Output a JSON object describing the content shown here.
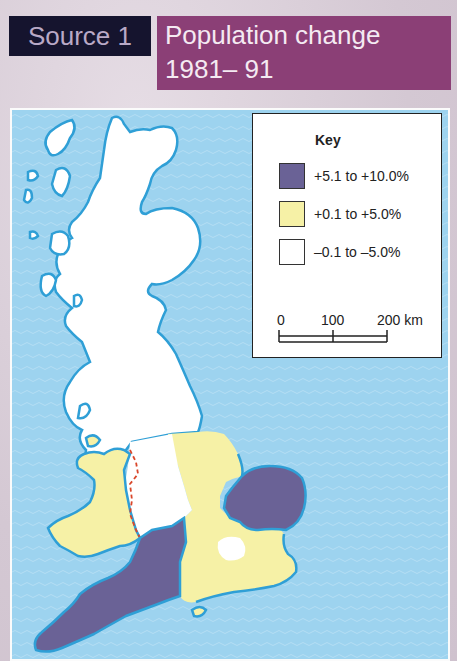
{
  "header": {
    "source_label": "Source 1",
    "title_line1": "Population change",
    "title_line2": "1981– 91"
  },
  "colors": {
    "source_bg": "#15142e",
    "title_bg": "#8b3f76",
    "sea": "#9dd3ef",
    "coastline": "#2f9fd6",
    "high_growth": "#6a6296",
    "low_growth": "#f6f1a6",
    "decline": "#ffffff",
    "border_dash": "#d9472b"
  },
  "key": {
    "title": "Key",
    "items": [
      {
        "label": "+5.1 to +10.0%",
        "color": "#6a6296"
      },
      {
        "label": "+0.1 to +5.0%",
        "color": "#f6f1a6"
      },
      {
        "label": "–0.1 to –5.0%",
        "color": "#ffffff"
      }
    ],
    "scale": {
      "ticks": [
        "0",
        "100",
        "200 km"
      ]
    }
  },
  "map": {
    "regions": [
      {
        "name": "Scotland",
        "category": "–0.1 to –5.0%"
      },
      {
        "name": "Northern England",
        "category": "–0.1 to –5.0%"
      },
      {
        "name": "West Midlands",
        "category": "–0.1 to –5.0%"
      },
      {
        "name": "Greater London",
        "category": "–0.1 to –5.0%"
      },
      {
        "name": "Wales",
        "category": "+0.1 to +5.0%"
      },
      {
        "name": "East Midlands",
        "category": "+0.1 to +5.0%"
      },
      {
        "name": "South East",
        "category": "+0.1 to +5.0%"
      },
      {
        "name": "East Anglia",
        "category": "+5.1 to +10.0%"
      },
      {
        "name": "South West",
        "category": "+5.1 to +10.0%"
      }
    ]
  }
}
